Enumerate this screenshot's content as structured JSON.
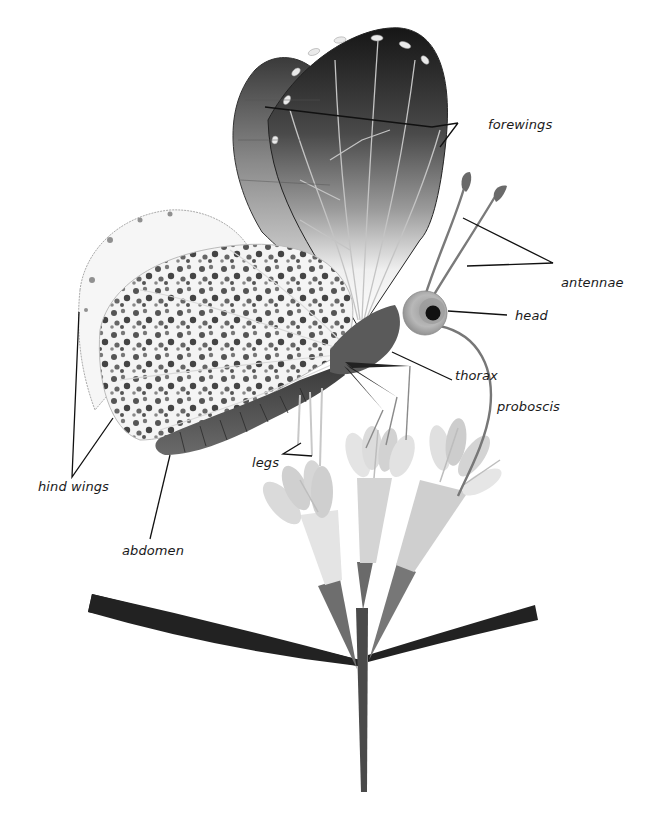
{
  "diagram": {
    "labels": {
      "forewings": "forewings",
      "antennae": "antennae",
      "head": "head",
      "thorax": "thorax",
      "proboscis": "proboscis",
      "legs": "legs",
      "hind_wings": "hind wings",
      "abdomen": "abdomen"
    },
    "colors": {
      "background": "#ffffff",
      "leader_line": "#111111",
      "wing_dark": "#1e1e1e",
      "wing_mid": "#7a7a7a",
      "wing_light": "#f2f2f2",
      "body": "#555555",
      "petal_light": "#d6d6d6",
      "petal_lighter": "#e6e6e6",
      "calyx": "#6e6e6e",
      "stem": "#4a4a4a",
      "leaf": "#222222"
    }
  }
}
